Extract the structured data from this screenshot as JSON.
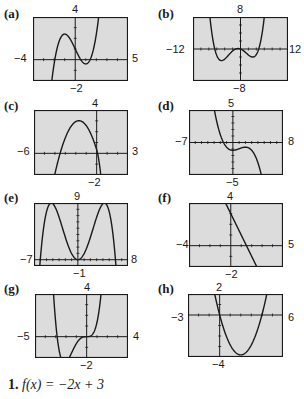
{
  "chart_data": [
    {
      "type": "line",
      "label": "(a)",
      "xlim": [
        -4,
        5
      ],
      "ylim": [
        -2,
        4
      ],
      "description": "cubic with local max near (-1, 2.4) and local min near (1, -0.4)",
      "ticks": {
        "top": "4",
        "bottom": "-2",
        "left": "-4",
        "right": "5"
      }
    },
    {
      "type": "line",
      "label": "(b)",
      "xlim": [
        -12,
        12
      ],
      "ylim": [
        -8,
        8
      ],
      "description": "quartic-like curve with max near (-4, 7), small bump near origin, min near (3, -7.5), rising steeply after",
      "ticks": {
        "top": "8",
        "bottom": "-8",
        "left": "-12",
        "right": "12"
      }
    },
    {
      "type": "line",
      "label": "(c)",
      "xlim": [
        -6,
        3
      ],
      "ylim": [
        -2,
        4
      ],
      "description": "downward-opening curve with max near (-1.8, 3), x-intercepts near -3.5 and 0.1",
      "ticks": {
        "top": "4",
        "bottom": "-2",
        "left": "-6",
        "right": "3"
      }
    },
    {
      "type": "line",
      "label": "(d)",
      "xlim": [
        -7,
        8
      ],
      "ylim": [
        -5,
        5
      ],
      "description": "decreasing cubic with local min near (0, -1.2) and local max near (2, -0.3)",
      "ticks": {
        "top": "5",
        "bottom": "-5",
        "left": "-7",
        "right": "8"
      }
    },
    {
      "type": "line",
      "label": "(e)",
      "xlim": [
        -7,
        8
      ],
      "ylim": [
        -1,
        9
      ],
      "description": "quartic with two maxima near (-3, 9) and (3, 9), min at origin, x-intercepts near -4.2 and 4.2",
      "ticks": {
        "top": "9",
        "bottom": "-1",
        "left": "-7",
        "right": "8"
      }
    },
    {
      "type": "line",
      "label": "(f)",
      "xlim": [
        -4,
        5
      ],
      "ylim": [
        -2,
        4
      ],
      "description": "line with negative slope, y-intercept 3, x-intercept 1.5",
      "ticks": {
        "top": "4",
        "bottom": "-2",
        "left": "-4",
        "right": "5"
      }
    },
    {
      "type": "line",
      "label": "(g)",
      "xlim": [
        -5,
        4
      ],
      "ylim": [
        -2,
        4
      ],
      "description": "quartic with min near (-3, -1.7), flat inflection at origin",
      "ticks": {
        "top": "4",
        "bottom": "-2",
        "left": "-5",
        "right": "4"
      }
    },
    {
      "type": "line",
      "label": "(h)",
      "xlim": [
        -3,
        6
      ],
      "ylim": [
        -4,
        2
      ],
      "description": "upward parabola with vertex near (2, -4), x-intercepts at 0 and 4",
      "ticks": {
        "top": "2",
        "bottom": "-4",
        "left": "-3",
        "right": "6"
      }
    }
  ],
  "panels": [
    {
      "label": "(a)",
      "top": "4",
      "bottom": "−2",
      "left": "−4",
      "right": "5"
    },
    {
      "label": "(b)",
      "top": "8",
      "bottom": "−8",
      "left": "−12",
      "right": "12"
    },
    {
      "label": "(c)",
      "top": "4",
      "bottom": "−2",
      "left": "−6",
      "right": "3"
    },
    {
      "label": "(d)",
      "top": "5",
      "bottom": "−5",
      "left": "−7",
      "right": "8"
    },
    {
      "label": "(e)",
      "top": "9",
      "bottom": "−1",
      "left": "−7",
      "right": "8"
    },
    {
      "label": "(f)",
      "top": "4",
      "bottom": "−2",
      "left": "−4",
      "right": "5"
    },
    {
      "label": "(g)",
      "top": "4",
      "bottom": "−2",
      "left": "−5",
      "right": "4"
    },
    {
      "label": "(h)",
      "top": "2",
      "bottom": "−4",
      "left": "−3",
      "right": "6"
    }
  ],
  "exercise": {
    "number": "1.",
    "expression": "f(x) = −2x + 3"
  },
  "colors": {
    "screen": "#dcdcdc",
    "ink": "#1a1a1a"
  }
}
